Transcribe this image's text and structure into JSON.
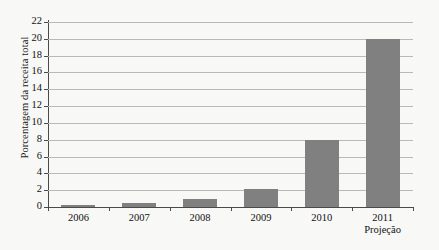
{
  "chart_data": {
    "type": "bar",
    "title": "",
    "xlabel": "",
    "ylabel": "Porcentagem da receita total",
    "categories": [
      "2006",
      "2007",
      "2008",
      "2009",
      "2010",
      "2011"
    ],
    "category_sublabels": [
      "",
      "",
      "",
      "",
      "",
      "Projeção"
    ],
    "values": [
      0.2,
      0.5,
      0.9,
      2.2,
      8.0,
      20.0
    ],
    "ylim": [
      0,
      22
    ],
    "ytick_values": [
      0,
      2,
      4,
      6,
      8,
      10,
      12,
      14,
      16,
      18,
      20,
      22
    ],
    "ytick_labels": [
      "0",
      "2",
      "4",
      "6",
      "8",
      "10",
      "12",
      "14",
      "16",
      "18",
      "20",
      "22"
    ],
    "grid": true,
    "legend": null,
    "legend_position": "none",
    "series": [
      {
        "name": "Porcentagem da receita total",
        "values": [
          0.2,
          0.5,
          0.9,
          2.2,
          8.0,
          20.0
        ]
      }
    ],
    "colors": {
      "bar": "#808080",
      "background": "#f8f8f6",
      "gridline": "#b9b9b9",
      "axis": "#4a4a4a",
      "text": "#111111"
    }
  }
}
